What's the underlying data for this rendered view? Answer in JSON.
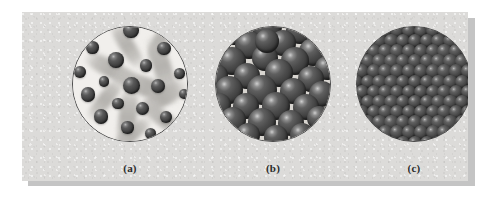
{
  "figure": {
    "panel_background": "#dcdbd9",
    "shadow_color": "#c4c4c4",
    "sphere_color": "#4a4a4a",
    "outline_color": "#4a4a4a"
  },
  "panels": [
    {
      "id": "gas",
      "caption": "(a)",
      "state": "gas",
      "description": "Widely separated particles moving rapidly, shown with motion-blur streaks",
      "background": "#f1efec",
      "particle_count": 19,
      "particles": [
        {
          "x": 50.0,
          "y": 4.0,
          "r": 7.6
        },
        {
          "x": 17.5,
          "y": 18.5,
          "r": 6.4
        },
        {
          "x": 78.0,
          "y": 19.0,
          "r": 6.8
        },
        {
          "x": 37.5,
          "y": 29.0,
          "r": 8.0
        },
        {
          "x": 62.5,
          "y": 33.5,
          "r": 6.2
        },
        {
          "x": 6.5,
          "y": 39.0,
          "r": 6.0
        },
        {
          "x": 91.0,
          "y": 40.0,
          "r": 5.4
        },
        {
          "x": 27.0,
          "y": 47.0,
          "r": 5.2
        },
        {
          "x": 50.5,
          "y": 50.5,
          "r": 8.6
        },
        {
          "x": 72.5,
          "y": 51.0,
          "r": 7.0
        },
        {
          "x": 13.5,
          "y": 58.0,
          "r": 7.2
        },
        {
          "x": 94.5,
          "y": 58.0,
          "r": 5.0
        },
        {
          "x": 39.0,
          "y": 66.0,
          "r": 5.6
        },
        {
          "x": 60.0,
          "y": 70.0,
          "r": 6.6
        },
        {
          "x": 24.5,
          "y": 76.5,
          "r": 7.4
        },
        {
          "x": 80.0,
          "y": 77.5,
          "r": 6.0
        },
        {
          "x": 47.0,
          "y": 86.0,
          "r": 6.2
        },
        {
          "x": 66.5,
          "y": 91.0,
          "r": 5.8
        },
        {
          "x": 12.0,
          "y": 92.0,
          "r": 5.2
        }
      ],
      "streaks": [
        {
          "x": 24,
          "y": 10,
          "w": 46,
          "h": 13,
          "rot": 58
        },
        {
          "x": 54,
          "y": 8,
          "w": 40,
          "h": 12,
          "rot": 112
        },
        {
          "x": 8,
          "y": 30,
          "w": 52,
          "h": 14,
          "rot": 28
        },
        {
          "x": 48,
          "y": 26,
          "w": 56,
          "h": 15,
          "rot": 72
        },
        {
          "x": 34,
          "y": 44,
          "w": 60,
          "h": 16,
          "rot": 20
        },
        {
          "x": 6,
          "y": 56,
          "w": 44,
          "h": 13,
          "rot": 128
        },
        {
          "x": 52,
          "y": 54,
          "w": 50,
          "h": 14,
          "rot": 148
        },
        {
          "x": 20,
          "y": 70,
          "w": 54,
          "h": 15,
          "rot": 96
        },
        {
          "x": 56,
          "y": 74,
          "w": 46,
          "h": 13,
          "rot": 36
        },
        {
          "x": 30,
          "y": 86,
          "w": 42,
          "h": 12,
          "rot": 140
        }
      ]
    },
    {
      "id": "liquid",
      "caption": "(b)",
      "state": "liquid",
      "description": "Particles in close contact but randomly arranged, with small gaps between them",
      "background": "#d8d5d0",
      "particle_count": 34,
      "particles": [
        {
          "x": 16,
          "y": 4,
          "r": 14
        },
        {
          "x": 44,
          "y": 0,
          "r": 15
        },
        {
          "x": 72,
          "y": 3,
          "r": 14
        },
        {
          "x": 94,
          "y": 10,
          "r": 13
        },
        {
          "x": 2,
          "y": 18,
          "r": 13
        },
        {
          "x": 29,
          "y": 16,
          "r": 14
        },
        {
          "x": 58,
          "y": 14,
          "r": 13
        },
        {
          "x": 83,
          "y": 22,
          "r": 14
        },
        {
          "x": 14,
          "y": 30,
          "r": 14
        },
        {
          "x": 42,
          "y": 27,
          "r": 13
        },
        {
          "x": 68,
          "y": 30,
          "r": 14
        },
        {
          "x": 95,
          "y": 36,
          "r": 12
        },
        {
          "x": 1,
          "y": 42,
          "r": 12
        },
        {
          "x": 27,
          "y": 42,
          "r": 13
        },
        {
          "x": 54,
          "y": 40,
          "r": 14
        },
        {
          "x": 81,
          "y": 45,
          "r": 13
        },
        {
          "x": 12,
          "y": 54,
          "r": 14
        },
        {
          "x": 40,
          "y": 54,
          "r": 15
        },
        {
          "x": 66,
          "y": 55,
          "r": 13
        },
        {
          "x": 91,
          "y": 58,
          "r": 13
        },
        {
          "x": 3,
          "y": 67,
          "r": 12
        },
        {
          "x": 26,
          "y": 68,
          "r": 13
        },
        {
          "x": 52,
          "y": 68,
          "r": 14
        },
        {
          "x": 77,
          "y": 69,
          "r": 13
        },
        {
          "x": 15,
          "y": 80,
          "r": 13
        },
        {
          "x": 40,
          "y": 81,
          "r": 14
        },
        {
          "x": 64,
          "y": 82,
          "r": 13
        },
        {
          "x": 88,
          "y": 78,
          "r": 12
        },
        {
          "x": 28,
          "y": 92,
          "r": 12
        },
        {
          "x": 52,
          "y": 94,
          "r": 12
        },
        {
          "x": 74,
          "y": 92,
          "r": 12
        },
        {
          "x": 6,
          "y": 90,
          "r": 11
        },
        {
          "x": 94,
          "y": 88,
          "r": 11
        },
        {
          "x": 44,
          "y": 13,
          "r": 12
        }
      ]
    },
    {
      "id": "solid",
      "caption": "(c)",
      "state": "solid",
      "description": "Particles packed in a regular, ordered close-packed lattice",
      "background": "#4a4a4a",
      "rows": 10,
      "columns": 10,
      "sphere_radius": 7.2,
      "row_offset": 5.8,
      "lattice": "close-packed hexagonal"
    }
  ]
}
